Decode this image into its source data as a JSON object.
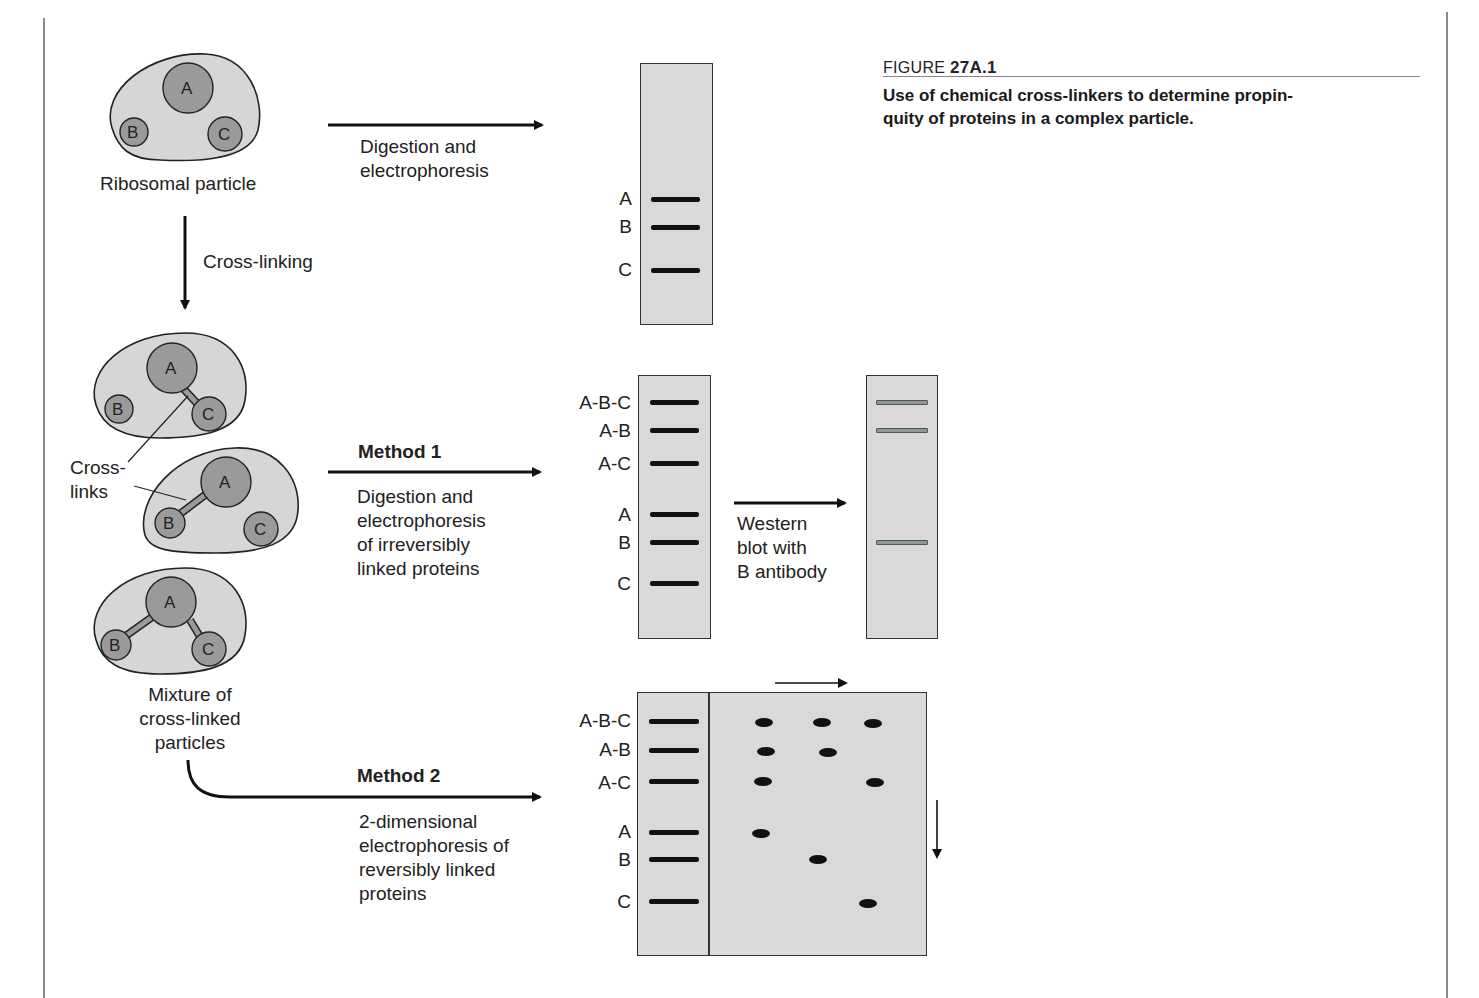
{
  "figure": {
    "number_prefix": "FIGURE",
    "number": "27A.1",
    "caption": "Use of chemical cross-linkers to determine propinquity of proteins in a complex particle.",
    "caption_line1": "Use of chemical cross-linkers to determine propin-",
    "caption_line2": "quity of proteins in a complex particle."
  },
  "particles": {
    "ribosomal_label": "Ribosomal particle",
    "proteins": [
      "A",
      "B",
      "C"
    ],
    "crosslinks_label_line1": "Cross-",
    "crosslinks_label_line2": "links",
    "mixture_label_line1": "Mixture of",
    "mixture_label_line2": "cross-linked",
    "mixture_label_line3": "particles"
  },
  "steps": {
    "cross_linking": "Cross-linking",
    "digestion_line1": "Digestion and",
    "digestion_line2": "electrophoresis",
    "method1_title": "Method 1",
    "method1_line1": "Digestion and",
    "method1_line2": "electrophoresis",
    "method1_line3": "of irreversibly",
    "method1_line4": "linked proteins",
    "western_line1": "Western",
    "western_line2": "blot with",
    "western_line3": "B antibody",
    "method2_title": "Method 2",
    "method2_line1": "2-dimensional",
    "method2_line2": "electrophoresis of",
    "method2_line3": "reversibly linked",
    "method2_line4": "proteins"
  },
  "gels": {
    "top": {
      "bands": [
        "A",
        "B",
        "C"
      ]
    },
    "method1": {
      "bands": [
        "A-B-C",
        "A-B",
        "A-C",
        "A",
        "B",
        "C"
      ]
    },
    "western": {
      "bands_detected": [
        "A-B-C",
        "A-B",
        "B"
      ]
    },
    "method2": {
      "bands": [
        "A-B-C",
        "A-B",
        "A-C",
        "A",
        "B",
        "C"
      ],
      "spot_columns": [
        "A",
        "B",
        "C"
      ],
      "spots": [
        {
          "row": "A-B-C",
          "col": "A"
        },
        {
          "row": "A-B-C",
          "col": "B"
        },
        {
          "row": "A-B-C",
          "col": "C"
        },
        {
          "row": "A-B",
          "col": "A"
        },
        {
          "row": "A-B",
          "col": "B"
        },
        {
          "row": "A-C",
          "col": "A"
        },
        {
          "row": "A-C",
          "col": "C"
        },
        {
          "row": "A",
          "col": "A"
        },
        {
          "row": "B",
          "col": "B"
        },
        {
          "row": "C",
          "col": "C"
        }
      ]
    }
  },
  "colors": {
    "particle_fill": "#d6d6d6",
    "protein_fill": "#9a9a9a",
    "gel_fill": "#d9d9d9",
    "band": "#111111",
    "western_band": "#8e9a8e"
  }
}
